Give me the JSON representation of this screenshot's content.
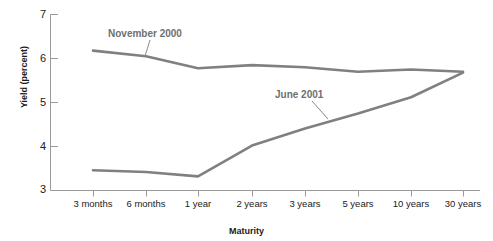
{
  "chart_data": {
    "type": "line",
    "title": "",
    "xlabel": "Maturity",
    "ylabel": "Yield (percent)",
    "ylim": [
      3,
      7
    ],
    "yticks": [
      3,
      4,
      5,
      6,
      7
    ],
    "grid": false,
    "legend_position": "inline-annotations",
    "categories": [
      "3 months",
      "6 months",
      "1 year",
      "2 years",
      "3 years",
      "5 years",
      "10 years",
      "30 years"
    ],
    "series": [
      {
        "name": "November 2000",
        "color": "#808080",
        "values": [
          6.18,
          6.05,
          5.78,
          5.85,
          5.8,
          5.7,
          5.75,
          5.7
        ]
      },
      {
        "name": "June 2001",
        "color": "#808080",
        "values": [
          3.46,
          3.42,
          3.32,
          4.02,
          4.41,
          4.75,
          5.12,
          5.68
        ]
      }
    ],
    "annotations": [
      {
        "text": "November 2000",
        "series": "November 2000",
        "at_category": "6 months"
      },
      {
        "text": "June 2001",
        "series": "June 2001",
        "at_category": "5 years"
      }
    ]
  },
  "axis": {
    "y_tick_labels": [
      "7",
      "6",
      "5",
      "4",
      "3"
    ],
    "x_tick_labels": [
      "3 months",
      "6 months",
      "1 year",
      "2 years",
      "3 years",
      "5 years",
      "10 years",
      "30 years"
    ],
    "y_axis_title": "Yield (percent)",
    "x_axis_title": "Maturity"
  },
  "colors": {
    "series_line": "#808080",
    "axis": "#9a9a9a",
    "annotation_text": "#6f6f6f",
    "tick_text": "#222222",
    "background": "#ffffff"
  }
}
